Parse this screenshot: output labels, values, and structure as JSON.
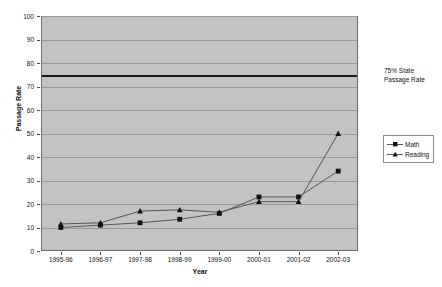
{
  "chart_data": {
    "type": "line",
    "title": "",
    "xlabel": "Year",
    "ylabel": "Passage Rate",
    "categories": [
      "1995-96",
      "1996-97",
      "1997-98",
      "1998-99",
      "1999-00",
      "2000-01",
      "2001-02",
      "2002-03"
    ],
    "series": [
      {
        "name": "Math",
        "marker": "square",
        "values": [
          10,
          11,
          12,
          13.5,
          16,
          23,
          23,
          34
        ]
      },
      {
        "name": "Reading",
        "marker": "triangle",
        "values": [
          11.5,
          12,
          17,
          17.5,
          16.5,
          21,
          21,
          50
        ]
      }
    ],
    "ylim": [
      0,
      100
    ],
    "ytick_step": 10,
    "yticks": [
      "0",
      "10",
      "20",
      "30",
      "40",
      "50",
      "60",
      "70",
      "80",
      "90",
      "100"
    ],
    "grid": true,
    "legend_position": "right",
    "reference_line": {
      "value": 75,
      "label": "75% State\nPassage Rate"
    },
    "annotations": [
      {
        "text_line1": "75% State",
        "text_line2": "Passage Rate",
        "value": 75
      }
    ],
    "colors": {
      "plot_background": "#c3c3c3",
      "page_background": "#ffffff",
      "gridline": "#9a9a9a",
      "series_line": "#555555",
      "marker": "#111111",
      "reference_line": "#1a1a1a",
      "axis_text": "#111111"
    }
  },
  "annotation": {
    "line1": "75% State",
    "line2": "Passage Rate"
  },
  "legend": {
    "items": [
      {
        "label": "Math"
      },
      {
        "label": "Reading"
      }
    ]
  },
  "axes": {
    "y_title": "Passage Rate",
    "x_title": "Year"
  }
}
